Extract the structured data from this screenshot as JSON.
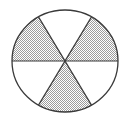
{
  "figure": {
    "title": "Circle divided into six equal sectors with alternating shading",
    "shape": "circle",
    "sector_count": 6,
    "shaded_count": 3,
    "unshaded_count": 3,
    "fraction_shaded": "3/6",
    "background_color": "#ffffff",
    "outline_color": "#3a3a3a",
    "shading_color": "#b8b8b8",
    "shading_style": "stipple",
    "unshaded_color": "#ffffff",
    "geometry": {
      "center_x": 65,
      "center_y": 61,
      "radius_x": 53,
      "radius_y": 51,
      "spoke_angles_deg": [
        0,
        60,
        120,
        180,
        240,
        300
      ],
      "stroke_width": 1.2
    },
    "sectors": [
      {
        "id": "sector-top",
        "label": "top",
        "start_deg": 240,
        "end_deg": 300,
        "shaded": false
      },
      {
        "id": "sector-upper-right",
        "label": "upper-right",
        "start_deg": 300,
        "end_deg": 360,
        "shaded": true
      },
      {
        "id": "sector-lower-right",
        "label": "lower-right",
        "start_deg": 0,
        "end_deg": 60,
        "shaded": false
      },
      {
        "id": "sector-bottom",
        "label": "bottom",
        "start_deg": 60,
        "end_deg": 120,
        "shaded": true
      },
      {
        "id": "sector-lower-left",
        "label": "lower-left",
        "start_deg": 120,
        "end_deg": 180,
        "shaded": false
      },
      {
        "id": "sector-upper-left",
        "label": "upper-left",
        "start_deg": 180,
        "end_deg": 240,
        "shaded": true
      }
    ],
    "diameters": [
      {
        "id": "diameter-horizontal",
        "angle_deg": 0
      },
      {
        "id": "diameter-diag-down",
        "angle_deg": 60
      },
      {
        "id": "diameter-diag-up",
        "angle_deg": 120
      }
    ]
  }
}
